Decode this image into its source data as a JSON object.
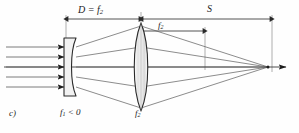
{
  "figure": {
    "label": "c)",
    "type": "optical-ray-diagram",
    "background_color": "#fefefe",
    "line_color": "#2a2a2a",
    "ray_color": "#555555"
  },
  "dimensions": [
    {
      "id": "D",
      "label_html": "D = f<sub>2</sub>",
      "label_text": "D = f2",
      "description": "distance from negative lens to positive lens",
      "x_start": 66,
      "x_end": 141,
      "y": 19
    },
    {
      "id": "f2",
      "label_html": "f<sub>2</sub>",
      "label_text": "f2",
      "description": "focal length of positive lens",
      "x_start": 141,
      "x_end": 205,
      "y": 31
    },
    {
      "id": "S",
      "label_html": "S",
      "label_text": "S",
      "description": "back focal distance to image point",
      "x_start": 141,
      "x_end": 272,
      "y": 19
    }
  ],
  "elements": [
    {
      "id": "lens1",
      "kind": "plano-concave-negative-lens",
      "label_html": "f<sub>1</sub> &lt; 0",
      "label_text": "f1 < 0",
      "x_center": 70,
      "y_center": 67,
      "half_height": 29
    },
    {
      "id": "lens2",
      "kind": "biconvex-positive-lens",
      "label_html": "f<sub>2</sub>",
      "label_text": "f2",
      "x_center": 141,
      "y_center": 67,
      "half_height": 44
    }
  ],
  "rays": {
    "incoming_count": 5,
    "incoming_arrowheads": true,
    "description": "five parallel rays entering from the left, diverging through the negative lens, refracted by the positive lens, converging to a focal point on the right",
    "focus_x": 268,
    "axis_y": 67
  },
  "axis": {
    "label": "optical-axis",
    "y": 67,
    "x_start": 4,
    "x_end": 292,
    "arrow_at_right": true
  }
}
